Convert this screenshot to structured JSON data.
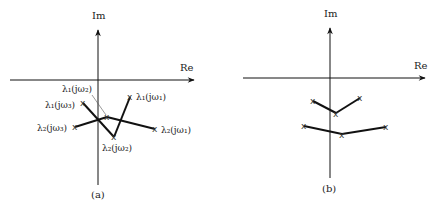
{
  "panels": [
    {
      "id": "a",
      "caption": "(a)",
      "axes": {
        "x_label": "Re",
        "y_label": "Im"
      },
      "points": [
        {
          "label": "λ1(jω1)",
          "x": 130,
          "y": 97
        },
        {
          "label": "λ1(jω2)",
          "x": 107,
          "y": 117
        },
        {
          "label": "λ1(jω3)",
          "x": 83,
          "y": 103
        },
        {
          "label": "λ2(jω1)",
          "x": 155,
          "y": 129
        },
        {
          "label": "λ2(jω2)",
          "x": 114,
          "y": 137
        },
        {
          "label": "λ2(jω3)",
          "x": 75,
          "y": 127
        }
      ],
      "labels": {
        "l1w2": "λ₁(jω₂)",
        "l1w3": "λ₁(jω₃)",
        "l1w1": "λ₁(jω₁)",
        "l2w3": "λ₂(jω₃)",
        "l2w1": "λ₂(jω₁)",
        "l2w2": "λ₂(jω₂)"
      }
    },
    {
      "id": "b",
      "caption": "(b)",
      "axes": {
        "x_label": "Re",
        "y_label": "Im"
      },
      "points": [
        {
          "x": 313,
          "y": 101
        },
        {
          "x": 336,
          "y": 113
        },
        {
          "x": 360,
          "y": 98
        },
        {
          "x": 304,
          "y": 126
        },
        {
          "x": 342,
          "y": 134
        },
        {
          "x": 386,
          "y": 127
        }
      ]
    }
  ],
  "marker": "x"
}
